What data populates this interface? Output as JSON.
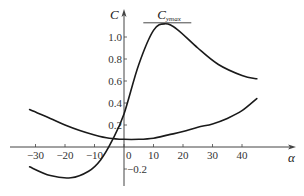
{
  "chart_data": {
    "type": "line",
    "title": "",
    "xlabel": "α",
    "ylabel": "C",
    "xlim": [
      -36,
      48
    ],
    "ylim": [
      -0.3,
      1.2
    ],
    "grid": false,
    "legend": null,
    "x_ticks": [
      -30,
      -20,
      -10,
      0,
      10,
      20,
      30,
      40
    ],
    "x_tick_labels": [
      "−30",
      "−20",
      "−10",
      "0",
      "10",
      "20",
      "30",
      "40"
    ],
    "y_ticks": [
      -0.2,
      0.2,
      0.4,
      0.6,
      0.8,
      1.0
    ],
    "y_tick_labels": [
      "−0.2",
      "0.2",
      "0.4",
      "0.6",
      "0.8",
      "1.0"
    ],
    "annotations": [
      {
        "text": "C_ymax",
        "display": "Cymax",
        "x": 14,
        "y": 1.12,
        "note": "horizontal line marking maximum of lift curve"
      }
    ],
    "series": [
      {
        "name": "lift coefficient C_y",
        "x": [
          -32,
          -25,
          -18,
          -12,
          -8,
          -4,
          0,
          5,
          10,
          14,
          18,
          25,
          32,
          40,
          45
        ],
        "y": [
          -0.18,
          -0.26,
          -0.28,
          -0.22,
          -0.12,
          0.06,
          0.3,
          0.75,
          1.06,
          1.12,
          1.07,
          0.9,
          0.75,
          0.65,
          0.62
        ]
      },
      {
        "name": "drag coefficient C_x",
        "x": [
          -32,
          -25,
          -20,
          -15,
          -10,
          -5,
          0,
          5,
          10,
          15,
          20,
          25,
          30,
          35,
          40,
          45
        ],
        "y": [
          0.34,
          0.26,
          0.2,
          0.15,
          0.11,
          0.08,
          0.07,
          0.07,
          0.08,
          0.11,
          0.14,
          0.18,
          0.21,
          0.26,
          0.33,
          0.44
        ]
      }
    ]
  }
}
